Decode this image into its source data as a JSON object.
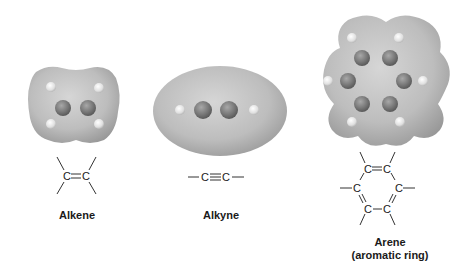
{
  "figure": {
    "panels": [
      {
        "id": "alkene",
        "name": "Alkene",
        "formula": "C=C",
        "atom_label": "C",
        "bond": "double"
      },
      {
        "id": "alkyne",
        "name": "Alkyne",
        "formula": "—C≡C—",
        "atom_label": "C",
        "bond": "triple"
      },
      {
        "id": "arene",
        "name": "Arene",
        "subtitle": "(aromatic ring)",
        "atom_label": "C",
        "bond": "aromatic"
      }
    ],
    "colors": {
      "surface_light": "#c9c9c9",
      "surface_dark": "#8f8f8f",
      "carbon_atom": "#7d7d7d",
      "hydrogen_atom": "#e6e6e6",
      "text": "#1a1a1a"
    }
  }
}
